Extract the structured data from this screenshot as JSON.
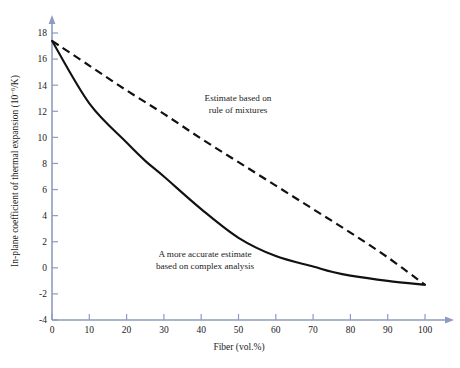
{
  "chart_data": {
    "type": "line",
    "title": "",
    "xlabel": "Fiber (vol.%)",
    "ylabel_prefix": "In-plane coefficient of thermal expansion (10",
    "ylabel_sup": "−6",
    "ylabel_suffix": "/K)",
    "ylabel_full": "In-plane coefficient of thermal expansion (10−6/K)",
    "xlim": [
      0,
      100
    ],
    "ylim": [
      -4,
      18
    ],
    "xticks": [
      0,
      10,
      20,
      30,
      40,
      50,
      60,
      70,
      80,
      90,
      100
    ],
    "yticks": [
      -4,
      -2,
      0,
      2,
      4,
      6,
      8,
      10,
      12,
      14,
      16,
      18
    ],
    "xtick_labels": [
      "0",
      "10",
      "20",
      "30",
      "40",
      "50",
      "60",
      "70",
      "80",
      "90",
      "100"
    ],
    "ytick_labels": [
      "-4",
      "-2",
      "0",
      "2",
      "4",
      "6",
      "8",
      "10",
      "12",
      "14",
      "16",
      "18"
    ],
    "grid": false,
    "legend": "none",
    "axis_color": "#8c9cbe",
    "curve_color": "#111111",
    "series": [
      {
        "name": "Estimate based on rule of mixtures",
        "style": "dashed",
        "x": [
          0,
          10,
          20,
          30,
          40,
          50,
          60,
          70,
          80,
          90,
          100
        ],
        "values": [
          17.4,
          15.5,
          13.6,
          11.8,
          9.9,
          8.1,
          6.3,
          4.5,
          2.7,
          0.8,
          -1.3
        ]
      },
      {
        "name": "A more accurate estimate based on complex analysis",
        "style": "solid",
        "x": [
          0,
          10,
          20,
          25,
          30,
          40,
          50,
          60,
          70,
          75,
          80,
          90,
          100
        ],
        "values": [
          17.4,
          12.6,
          9.6,
          8.2,
          7.0,
          4.5,
          2.3,
          0.9,
          0.1,
          -0.3,
          -0.6,
          -1.0,
          -1.3
        ]
      }
    ],
    "annotations": [
      {
        "id": "annotation-rule-of-mixtures",
        "lines": [
          "Estimate based on",
          "rule of mixtures"
        ],
        "x_px": 238,
        "y_px": 101
      },
      {
        "id": "annotation-complex-analysis",
        "lines": [
          "A more accurate estimate",
          "based on complex analysis"
        ],
        "x_px": 205,
        "y_px": 257
      }
    ]
  }
}
